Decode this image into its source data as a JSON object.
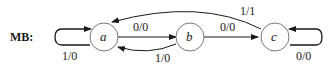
{
  "diagram": {
    "title": "MB:",
    "type": "state-machine",
    "states": [
      {
        "id": "a",
        "label": "a"
      },
      {
        "id": "b",
        "label": "b"
      },
      {
        "id": "c",
        "label": "c"
      }
    ],
    "transitions": [
      {
        "from": "a",
        "to": "a",
        "label": "1/0"
      },
      {
        "from": "a",
        "to": "b",
        "label": "0/0"
      },
      {
        "from": "b",
        "to": "a",
        "label": "1/0"
      },
      {
        "from": "b",
        "to": "c",
        "label": "0/0"
      },
      {
        "from": "c",
        "to": "a",
        "label": "1/1"
      },
      {
        "from": "c",
        "to": "c",
        "label": "0/0"
      }
    ],
    "colors": {
      "stroke": "#1a1a1a",
      "node_fill": "#ffffff"
    }
  }
}
